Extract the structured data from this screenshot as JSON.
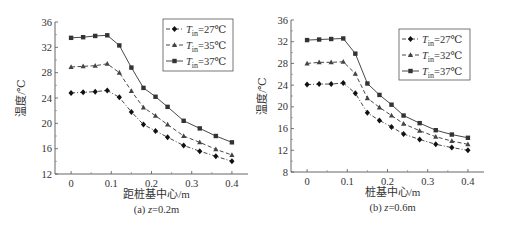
{
  "chart_data": [
    {
      "type": "line",
      "ylabel": "温度/℃",
      "xlabel": "距桩基中心/m",
      "caption_prefix": "(a) ",
      "caption_var": "z",
      "caption_value": "=0.2m",
      "xlim": [
        -0.04,
        0.44
      ],
      "ylim": [
        12,
        36
      ],
      "xticks": [
        0,
        0.1,
        0.2,
        0.3,
        0.4
      ],
      "xtick_labels": [
        "0",
        "0.1",
        "0.2",
        "0.3",
        "0.4"
      ],
      "yticks": [
        12,
        16,
        20,
        24,
        28,
        32,
        36
      ],
      "ytick_labels": [
        "12",
        "16",
        "20",
        "24",
        "28",
        "32",
        "36"
      ],
      "legend_position": "top-right",
      "x": [
        0,
        0.03,
        0.06,
        0.09,
        0.12,
        0.15,
        0.18,
        0.21,
        0.24,
        0.28,
        0.32,
        0.36,
        0.4
      ],
      "series": [
        {
          "name": "T_in=27℃",
          "label_main": "T",
          "label_sub": "in",
          "label_rest": "=27℃",
          "marker": "diamond",
          "dash": "dashdot",
          "values": [
            24.8,
            24.9,
            25.0,
            25.2,
            24.1,
            21.8,
            19.8,
            18.8,
            17.8,
            16.5,
            15.6,
            14.8,
            14.0
          ]
        },
        {
          "name": "T_in=35℃",
          "label_main": "T",
          "label_sub": "in",
          "label_rest": "=35℃",
          "marker": "triangle",
          "dash": "dashed",
          "values": [
            28.9,
            29.0,
            29.1,
            29.4,
            28.0,
            25.1,
            22.5,
            21.2,
            19.8,
            18.0,
            17.0,
            15.9,
            15.0
          ]
        },
        {
          "name": "T_in=37℃",
          "label_main": "T",
          "label_sub": "in",
          "label_rest": "=37℃",
          "marker": "square",
          "dash": "solid",
          "values": [
            33.5,
            33.6,
            33.8,
            33.9,
            32.3,
            28.8,
            25.6,
            24.2,
            22.6,
            20.4,
            19.2,
            18.0,
            17.0
          ]
        }
      ]
    },
    {
      "type": "line",
      "ylabel": "温度/℃",
      "xlabel": "桩基中心/m",
      "caption_prefix": "(b) ",
      "caption_var": "z",
      "caption_value": "=0.6m",
      "xlim": [
        -0.04,
        0.44
      ],
      "ylim": [
        8,
        36
      ],
      "xticks": [
        0,
        0.1,
        0.2,
        0.3,
        0.4
      ],
      "xtick_labels": [
        "0",
        "0.1",
        "0.2",
        "0.3",
        "0.4"
      ],
      "yticks": [
        8,
        12,
        16,
        20,
        24,
        28,
        32,
        36
      ],
      "ytick_labels": [
        "8",
        "12",
        "16",
        "20",
        "24",
        "28",
        "32",
        "36"
      ],
      "legend_position": "top-right",
      "x": [
        0,
        0.03,
        0.06,
        0.09,
        0.12,
        0.15,
        0.18,
        0.21,
        0.24,
        0.28,
        0.32,
        0.36,
        0.4
      ],
      "series": [
        {
          "name": "T_in=27℃",
          "label_main": "T",
          "label_sub": "in",
          "label_rest": "=27℃",
          "marker": "diamond",
          "dash": "dashdot",
          "values": [
            24.1,
            24.2,
            24.2,
            24.4,
            22.5,
            18.9,
            17.5,
            16.3,
            15.0,
            14.0,
            13.1,
            12.5,
            12.0
          ]
        },
        {
          "name": "T_in=32℃",
          "label_main": "T",
          "label_sub": "in",
          "label_rest": "=32℃",
          "marker": "triangle",
          "dash": "dashed",
          "values": [
            28.0,
            28.2,
            28.2,
            28.3,
            26.1,
            21.6,
            19.9,
            18.4,
            16.9,
            15.6,
            14.5,
            13.7,
            13.1
          ]
        },
        {
          "name": "T_in=37℃",
          "label_main": "T",
          "label_sub": "in",
          "label_rest": "=37℃",
          "marker": "square",
          "dash": "solid",
          "values": [
            32.3,
            32.4,
            32.5,
            32.6,
            29.8,
            24.3,
            22.2,
            20.4,
            18.4,
            17.0,
            15.7,
            14.9,
            14.3
          ]
        }
      ]
    }
  ]
}
